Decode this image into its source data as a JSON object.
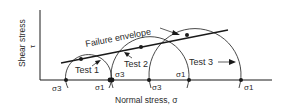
{
  "diagram": {
    "y_axis_label": "Shear stress",
    "y_axis_symbol": "τ",
    "x_axis_label": "Normal stress, σ",
    "envelope_label": "Failure envelope",
    "tests": [
      {
        "label": "Test 1",
        "sigma3": "σ3",
        "sigma1": "σ1"
      },
      {
        "label": "Test 2",
        "sigma3": "σ3",
        "sigma1": "σ1"
      },
      {
        "label": "Test 3",
        "sigma3": "σ3",
        "sigma1": "σ1"
      }
    ],
    "colors": {
      "line": "#1a1a1a",
      "text": "#2a2a2a",
      "background": "#ffffff"
    }
  }
}
